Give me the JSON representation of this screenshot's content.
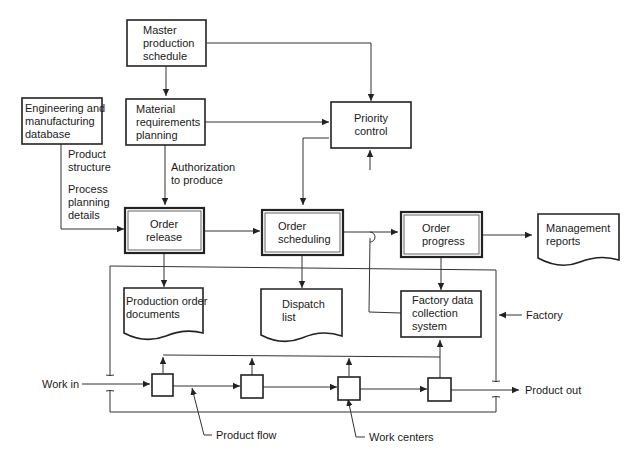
{
  "diagram": {
    "nodes": {
      "master_schedule": [
        "Master",
        "production",
        "schedule"
      ],
      "mrp": [
        "Material",
        "requirements",
        "planning"
      ],
      "eng_db": [
        "Engineering and",
        "manufacturing",
        "database"
      ],
      "priority_control": [
        "Priority",
        "control"
      ],
      "order_release": [
        "Order",
        "release"
      ],
      "order_scheduling": [
        "Order",
        "scheduling"
      ],
      "order_progress": [
        "Order",
        "progress"
      ],
      "management_reports": [
        "Management",
        "reports"
      ],
      "production_order_docs": [
        "Production order",
        "documents"
      ],
      "dispatch_list": [
        "Dispatch",
        "list"
      ],
      "factory_data_collection": [
        "Factory data",
        "collection",
        "system"
      ]
    },
    "labels": {
      "product_structure": [
        "Product",
        "structure"
      ],
      "process_planning": [
        "Process",
        "planning",
        "details"
      ],
      "authorization": [
        "Authorization",
        "to produce"
      ],
      "factory": "Factory",
      "work_in": "Work in",
      "product_out": "Product out",
      "product_flow": "Product flow",
      "work_centers": "Work centers"
    }
  }
}
